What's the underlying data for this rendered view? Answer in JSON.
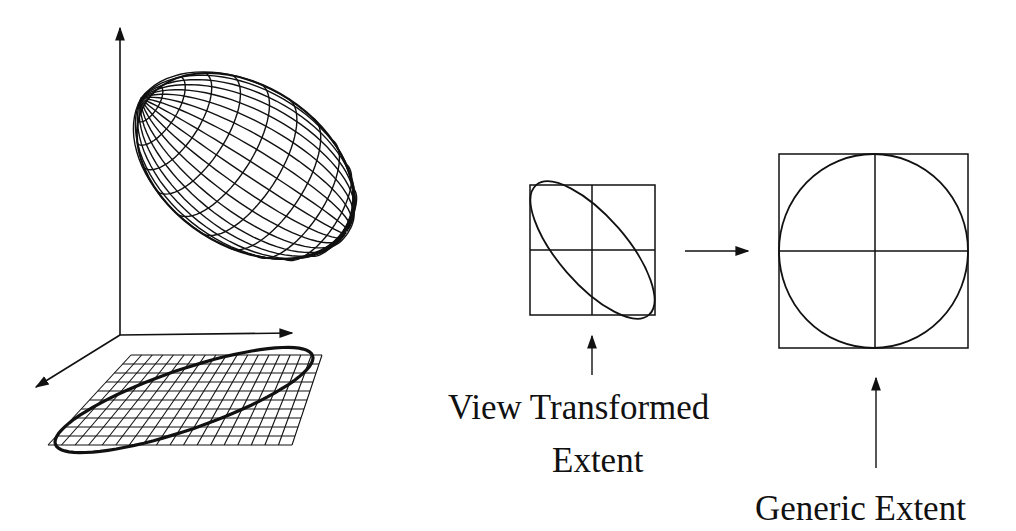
{
  "figure": {
    "background": "#ffffff",
    "stroke": "#111111",
    "left_panel": {
      "description": "3D coordinate axes with a wireframe ellipsoid above and its projection as an ellipse on a grid plane",
      "axes": [
        "vertical-axis",
        "horizontal-axis",
        "depth-axis"
      ],
      "ellipsoid": {
        "style": "wireframe",
        "meridians": 18,
        "parallels": 12
      },
      "ground_grid": {
        "rows": 10,
        "cols": 18,
        "projected_ellipse": true
      }
    },
    "middle_panel": {
      "box": "tilted ellipse inside square with center crosshair",
      "label_line1": "View Transformed",
      "label_line2": "Extent"
    },
    "right_panel": {
      "box": "circle inscribed in square with center crosshair",
      "label": "Generic Extent"
    }
  }
}
